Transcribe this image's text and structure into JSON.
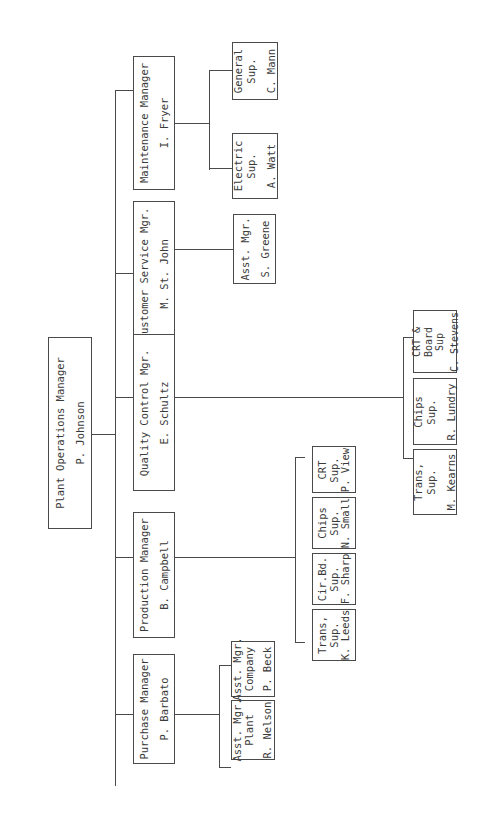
{
  "chart": {
    "orientation": "rotated-90-ccw",
    "root": {
      "title": "Plant Operations Manager",
      "name": "P. Johnson"
    },
    "managers": [
      {
        "title": "Purchase Manager",
        "name": "P. Barbato",
        "reports": [
          {
            "lines": [
              "Asst. Mgr.",
              "Plant"
            ],
            "name": "R. Nelson"
          },
          {
            "lines": [
              "Asst. Mgr.",
              "Company"
            ],
            "name": "P. Beck"
          }
        ]
      },
      {
        "title": "Production Manager",
        "name": "B. Campbell",
        "reports": [
          {
            "lines": [
              "Trans,",
              "Sup."
            ],
            "name": "K. Leeds"
          },
          {
            "lines": [
              "Cir.Bd.",
              "Sup."
            ],
            "name": "F. Sharp"
          },
          {
            "lines": [
              "Chips",
              "Sup."
            ],
            "name": "N. Small"
          },
          {
            "lines": [
              "CRT",
              "Sup."
            ],
            "name": "P. View"
          }
        ]
      },
      {
        "title": "Quality Control Mgr.",
        "name": "E. Schultz",
        "reports": [
          {
            "lines": [
              "Trans,",
              "Sup."
            ],
            "name": "M. Kearns"
          },
          {
            "lines": [
              "Chips",
              "Sup."
            ],
            "name": "R. Lundry"
          },
          {
            "lines": [
              "CRT &",
              "Board",
              "Sup"
            ],
            "name": "C. Stevens"
          }
        ]
      },
      {
        "title": "Customer Service Mgr.",
        "name": "M. St. John",
        "reports": [
          {
            "lines": [
              "Asst. Mgr."
            ],
            "name": "S. Greene"
          }
        ]
      },
      {
        "title": "Maintenance Manager",
        "name": "I. Fryer",
        "reports": [
          {
            "lines": [
              "Electric",
              "Sup."
            ],
            "name": "A. Watt"
          },
          {
            "lines": [
              "General",
              "Sup."
            ],
            "name": "C. Mann"
          }
        ]
      }
    ]
  }
}
